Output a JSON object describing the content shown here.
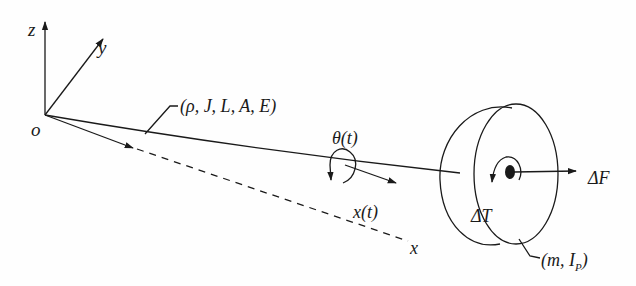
{
  "diagram": {
    "type": "mechanical schematic",
    "colors": {
      "ink": "#1a1a1a",
      "background": "#fefefe"
    },
    "axes": {
      "origin_label": "o",
      "z_label": "z",
      "y_label": "y",
      "x_label": "x"
    },
    "beam": {
      "parameters_label": "(ρ, J, L, A, E)"
    },
    "motion": {
      "rotation_label": "θ(t)",
      "displacement_label": "x(t)"
    },
    "disk": {
      "torque_label": "ΔT",
      "force_label": "ΔF",
      "parameters_label_open": "(m, I",
      "parameters_label_sub": "P",
      "parameters_label_close": ")"
    }
  }
}
